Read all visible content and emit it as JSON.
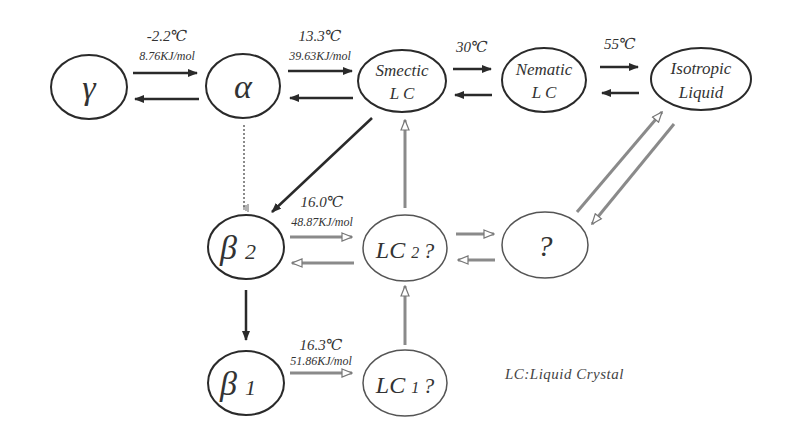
{
  "diagram": {
    "nodes": {
      "gamma": {
        "label": "γ"
      },
      "alpha": {
        "label": "α"
      },
      "smectic": {
        "line1": "Smectic",
        "line2": "L C"
      },
      "nematic": {
        "line1": "Nematic",
        "line2": "L C"
      },
      "isotropic": {
        "line1": "Isotropic",
        "line2": "Liquid"
      },
      "beta2": {
        "symbol": "β",
        "sub": "2"
      },
      "lc2": {
        "main": "LC",
        "sub": "2",
        "suffix": "?"
      },
      "unknown": {
        "label": "?"
      },
      "beta1": {
        "symbol": "β",
        "sub": "1"
      },
      "lc1": {
        "main": "LC",
        "sub": "1",
        "suffix": "?"
      }
    },
    "transitions": {
      "gamma_alpha": {
        "temp": "-2.2℃",
        "enthalpy": "8.76KJ/mol"
      },
      "alpha_smectic": {
        "temp": "13.3℃",
        "enthalpy": "39.63KJ/mol"
      },
      "smectic_nematic": {
        "temp": "30℃"
      },
      "nematic_isotropic": {
        "temp": "55℃"
      },
      "beta2_lc2": {
        "temp": "16.0℃",
        "enthalpy": "48.87KJ/mol"
      },
      "beta1_lc1": {
        "temp": "16.3℃",
        "enthalpy": "51.86KJ/mol"
      }
    },
    "legend": {
      "note": "LC:Liquid Crystal"
    },
    "colors": {
      "solid": "#2a2a2a",
      "hollow": "#8a8a8a",
      "ellipse_dark": "#2a2a2a",
      "ellipse_light": "#555555"
    }
  }
}
